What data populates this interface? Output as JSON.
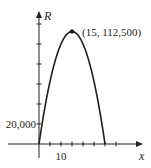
{
  "chart_data": {
    "type": "line",
    "title": "",
    "xlabel": "x",
    "ylabel": "R",
    "xlim": [
      0,
      36
    ],
    "ylim": [
      0,
      125000
    ],
    "x_ticks": [
      5,
      10,
      15,
      20,
      25,
      30,
      35
    ],
    "x_tick_labels": [
      {
        "value": 10,
        "label": "10"
      }
    ],
    "y_ticks": [
      20000,
      40000,
      60000,
      80000,
      100000,
      120000
    ],
    "y_tick_labels": [
      {
        "value": 20000,
        "label": "20,000"
      }
    ],
    "grid": false,
    "series": [
      {
        "name": "R = -500x^2 + 15000x",
        "x": [
          0,
          2,
          4,
          6,
          8,
          10,
          12,
          14,
          15,
          16,
          18,
          20,
          22,
          24,
          26,
          28,
          30
        ],
        "y": [
          0,
          28000,
          52000,
          72000,
          88000,
          100000,
          108000,
          112000,
          112500,
          112000,
          108000,
          100000,
          88000,
          72000,
          52000,
          28000,
          0
        ]
      }
    ],
    "annotations": [
      {
        "x": 15,
        "y": 112500,
        "label": "(15, 112,500)",
        "marker": "dot"
      }
    ]
  }
}
